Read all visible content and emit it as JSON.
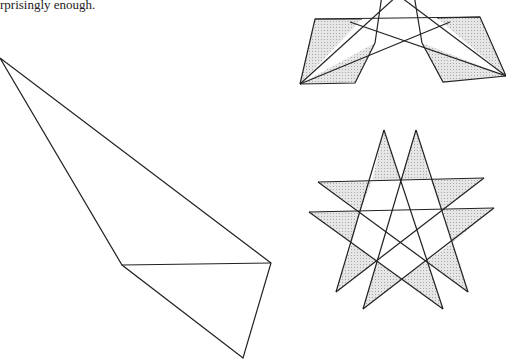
{
  "caption": "rprisingly enough.",
  "colors": {
    "stroke": "#222222",
    "shade": "#d9d9d9",
    "background": "#ffffff"
  },
  "figures": {
    "kite": {
      "points": [
        [
          0,
          58
        ],
        [
          122,
          265
        ],
        [
          243,
          358
        ],
        [
          271,
          263
        ]
      ],
      "chord": [
        [
          122,
          265
        ],
        [
          271,
          263
        ]
      ]
    },
    "crossed_parallelograms": {
      "left_parallelogram": [
        [
          315,
          19
        ],
        [
          362,
          19
        ],
        [
          355,
          83
        ],
        [
          300,
          84
        ]
      ],
      "right_parallelogram": [
        [
          437,
          18
        ],
        [
          480,
          17
        ],
        [
          506,
          76
        ],
        [
          443,
          82
        ]
      ]
    },
    "double_pentagram": {
      "peaks": [
        [
          384,
          130
        ],
        [
          416,
          130
        ]
      ],
      "left_tips": [
        [
          318,
          182
        ],
        [
          309,
          212
        ]
      ],
      "right_tips": [
        [
          484,
          178
        ],
        [
          494,
          208
        ]
      ],
      "bottom_tips": [
        [
          336,
          292
        ],
        [
          363,
          309
        ],
        [
          443,
          309
        ],
        [
          468,
          292
        ]
      ]
    }
  }
}
